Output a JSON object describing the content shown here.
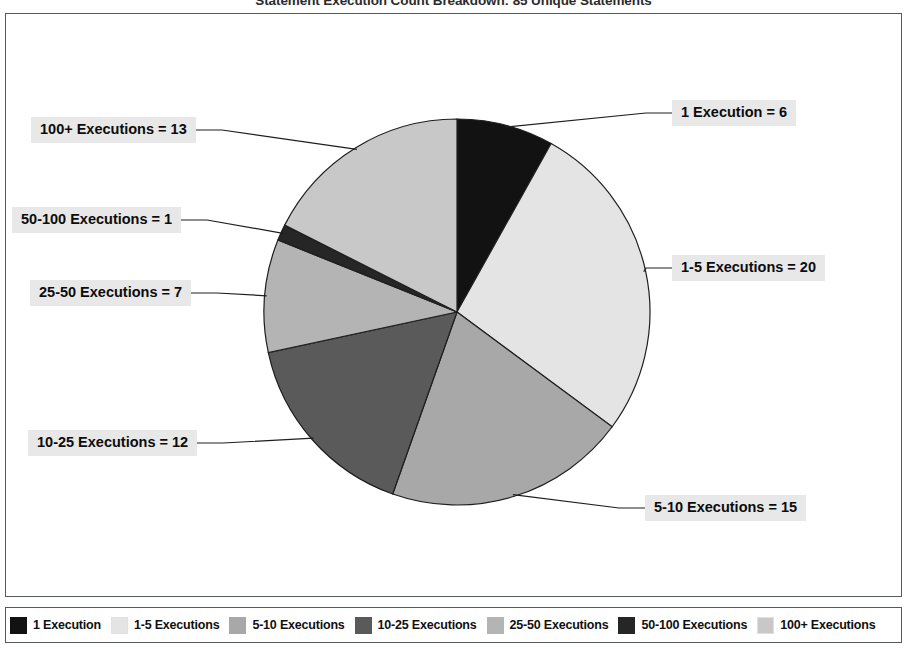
{
  "chart_data": {
    "type": "pie",
    "title": "Statement Execution Count Breakdown: 85 Unique Statements",
    "xlabel": "",
    "ylabel": "",
    "grid": false,
    "legend_position": "bottom",
    "total": 74,
    "categories": [
      "1 Execution",
      "1-5 Executions",
      "5-10 Executions",
      "10-25 Executions",
      "25-50 Executions",
      "50-100 Executions",
      "100+ Executions"
    ],
    "values": [
      6,
      20,
      15,
      12,
      7,
      1,
      13
    ],
    "colors": [
      "#121212",
      "#e4e4e4",
      "#a8a8a8",
      "#5a5a5a",
      "#b4b4b4",
      "#262626",
      "#c8c8c8"
    ],
    "annotations": [
      "1 Execution = 6",
      "1-5 Executions = 20",
      "5-10 Executions = 15",
      "10-25 Executions = 12",
      "25-50 Executions = 7",
      "50-100 Executions = 1",
      "100+ Executions = 13"
    ]
  },
  "callouts": [
    {
      "text": "1 Execution = 6",
      "left": 672,
      "top": 100
    },
    {
      "text": "1-5 Executions = 20",
      "left": 672,
      "top": 255
    },
    {
      "text": "5-10 Executions = 15",
      "left": 645,
      "top": 495
    },
    {
      "text": "10-25 Executions = 12",
      "left": 28,
      "top": 430
    },
    {
      "text": "25-50 Executions = 7",
      "left": 30,
      "top": 280
    },
    {
      "text": "50-100 Executions = 1",
      "left": 12,
      "top": 207
    },
    {
      "text": "100+ Executions = 13",
      "left": 31,
      "top": 117
    }
  ],
  "legend": {
    "items": [
      {
        "label": "1 Execution",
        "color": "#121212"
      },
      {
        "label": "1-5 Executions",
        "color": "#e4e4e4"
      },
      {
        "label": "5-10 Executions",
        "color": "#a8a8a8"
      },
      {
        "label": "10-25 Executions",
        "color": "#5a5a5a"
      },
      {
        "label": "25-50 Executions",
        "color": "#b4b4b4"
      },
      {
        "label": "50-100 Executions",
        "color": "#262626"
      },
      {
        "label": "100+ Executions",
        "color": "#c8c8c8"
      }
    ]
  },
  "style": {
    "pie_center_x": 457,
    "pie_center_y": 312,
    "pie_radius": 193,
    "stroke": "#1e1e1e",
    "frame_color": "#555a5e",
    "callout_bg": "#e8e8e8"
  }
}
